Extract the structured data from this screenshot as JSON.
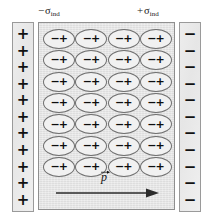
{
  "figure": {
    "colors": {
      "background": "#ffffff",
      "plate_fill": "#ececec",
      "plate_border": "#9a9a9a",
      "slab_fill": "#e4e4e4",
      "slab_border": "#8f8f8f",
      "dipole_border": "#6f6f6f",
      "ink": "#111111"
    }
  },
  "labels": {
    "negative_induced_charge": {
      "sign": "−",
      "symbol": "σ",
      "subscript": "ind",
      "full": "− σind"
    },
    "positive_induced_charge": {
      "sign": "+",
      "symbol": "σ",
      "subscript": "ind",
      "full": "+ σind"
    }
  },
  "plates": {
    "left": {
      "name": "positive-plate",
      "charge_symbol": "+",
      "count": 11,
      "charges": [
        "+",
        "+",
        "+",
        "+",
        "+",
        "+",
        "+",
        "+",
        "+",
        "+",
        "+"
      ]
    },
    "right": {
      "name": "negative-plate",
      "charge_symbol": "−",
      "count": 11,
      "charges": [
        "−",
        "−",
        "−",
        "−",
        "−",
        "−",
        "−",
        "−",
        "−",
        "−",
        "−"
      ]
    }
  },
  "dielectric": {
    "name": "dielectric-slab",
    "rows": 7,
    "columns": 4,
    "dipole": {
      "negative_end": "−",
      "positive_end": "+",
      "orientation": "negative-left-positive-right"
    },
    "dipoles": [
      [
        {
          "neg": "−",
          "pos": "+"
        },
        {
          "neg": "−",
          "pos": "+"
        },
        {
          "neg": "−",
          "pos": "+"
        },
        {
          "neg": "−",
          "pos": "+"
        }
      ],
      [
        {
          "neg": "−",
          "pos": "+"
        },
        {
          "neg": "−",
          "pos": "+"
        },
        {
          "neg": "−",
          "pos": "+"
        },
        {
          "neg": "−",
          "pos": "+"
        }
      ],
      [
        {
          "neg": "−",
          "pos": "+"
        },
        {
          "neg": "−",
          "pos": "+"
        },
        {
          "neg": "−",
          "pos": "+"
        },
        {
          "neg": "−",
          "pos": "+"
        }
      ],
      [
        {
          "neg": "−",
          "pos": "+"
        },
        {
          "neg": "−",
          "pos": "+"
        },
        {
          "neg": "−",
          "pos": "+"
        },
        {
          "neg": "−",
          "pos": "+"
        }
      ],
      [
        {
          "neg": "−",
          "pos": "+"
        },
        {
          "neg": "−",
          "pos": "+"
        },
        {
          "neg": "−",
          "pos": "+"
        },
        {
          "neg": "−",
          "pos": "+"
        }
      ],
      [
        {
          "neg": "−",
          "pos": "+"
        },
        {
          "neg": "−",
          "pos": "+"
        },
        {
          "neg": "−",
          "pos": "+"
        },
        {
          "neg": "−",
          "pos": "+"
        }
      ],
      [
        {
          "neg": "−",
          "pos": "+"
        },
        {
          "neg": "−",
          "pos": "+"
        },
        {
          "neg": "−",
          "pos": "+"
        },
        {
          "neg": "−",
          "pos": "+"
        }
      ]
    ]
  },
  "polarization_arrow": {
    "name": "polarization-vector",
    "label": "p",
    "label_style": "italic-with-vector-arrow",
    "direction": "right"
  }
}
